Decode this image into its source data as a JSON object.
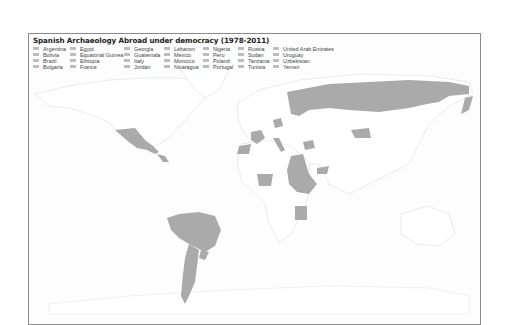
{
  "map": {
    "title": "Spanish Archaeology Abroad under democracy  (1978-2011)",
    "fill_color": "#aaaaaa",
    "unfilled_color": "#ffffff",
    "border_color": "#8a8a8a",
    "legend": {
      "swatch_color": "#bdbdbd",
      "columns": [
        [
          "Argentina",
          "Bolivia",
          "Brazil",
          "Bulgaria"
        ],
        [
          "Egypt",
          "Equatorial Guinea",
          "Ethiopia",
          "France"
        ],
        [
          "Georgia",
          "Guatemala",
          "Italy",
          "Jordan"
        ],
        [
          "Lebanon",
          "Mexico",
          "Morocco",
          "Nicaragua"
        ],
        [
          "Nigeria",
          "Peru",
          "Poland",
          "Portugal"
        ],
        [
          "Russia",
          "Sudan",
          "Tanzania",
          "Tunisia"
        ],
        [
          "United Arab Emirates",
          "Uruguay",
          "Uzbekistan",
          "Yemen"
        ]
      ]
    },
    "highlighted_countries": [
      "Argentina",
      "Bolivia",
      "Brazil",
      "Bulgaria",
      "Egypt",
      "Equatorial Guinea",
      "Ethiopia",
      "France",
      "Georgia",
      "Guatemala",
      "Italy",
      "Jordan",
      "Lebanon",
      "Mexico",
      "Morocco",
      "Nicaragua",
      "Nigeria",
      "Peru",
      "Poland",
      "Portugal",
      "Russia",
      "Sudan",
      "Tanzania",
      "Tunisia",
      "United Arab Emirates",
      "Uruguay",
      "Uzbekistan",
      "Yemen"
    ]
  }
}
